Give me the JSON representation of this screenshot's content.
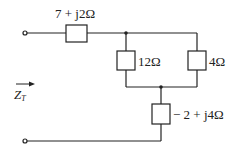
{
  "diagram": {
    "type": "circuit",
    "labels": {
      "series_top": "7 + j2Ω",
      "parallel_left": "12Ω",
      "parallel_right": "4Ω",
      "series_bottom": "− 2 + j4Ω",
      "impedance_symbol": "Z",
      "impedance_subscript": "T"
    },
    "components": [
      {
        "id": "Z1",
        "value": "7 + j2Ω",
        "position": "top series"
      },
      {
        "id": "R1",
        "value": "12Ω",
        "position": "parallel branch left"
      },
      {
        "id": "R2",
        "value": "4Ω",
        "position": "parallel branch right"
      },
      {
        "id": "Z2",
        "value": "-2 + j4Ω",
        "position": "vertical series to bottom"
      }
    ],
    "terminals": 2,
    "junctions": 2
  }
}
